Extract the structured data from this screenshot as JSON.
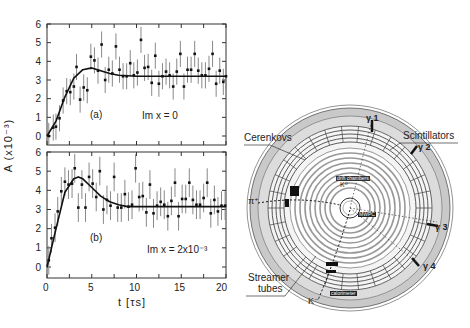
{
  "figure": {
    "ylabel": "A (x10⁻³)",
    "xlabel": "t [τs]",
    "xticks": [
      "0",
      "5",
      "10",
      "15",
      "20"
    ],
    "yticks": [
      "0",
      "1",
      "2",
      "3",
      "4",
      "5",
      "6"
    ]
  },
  "chart_data": [
    {
      "type": "scatter",
      "panel": "(a)",
      "annotation": "Im x = 0",
      "xlabel": "t [τs]",
      "ylabel": "A (x10⁻³)",
      "xlim": [
        0,
        20
      ],
      "ylim": [
        -0.5,
        6.2
      ],
      "series": [
        {
          "name": "data",
          "x": [
            0.2,
            0.7,
            1.0,
            1.4,
            1.8,
            2.2,
            2.6,
            3.0,
            3.3,
            3.7,
            4.1,
            4.5,
            4.9,
            5.3,
            5.7,
            6.1,
            6.5,
            6.9,
            7.3,
            7.7,
            8.1,
            8.5,
            8.9,
            9.3,
            9.7,
            10.1,
            10.5,
            10.9,
            11.3,
            11.7,
            12.1,
            12.5,
            12.9,
            13.3,
            13.7,
            14.1,
            14.5,
            14.9,
            15.3,
            15.7,
            16.1,
            16.5,
            16.9,
            17.3,
            17.7,
            18.1,
            18.5,
            18.9,
            19.3,
            19.7,
            20.0
          ],
          "y": [
            0.0,
            0.45,
            0.5,
            0.95,
            1.9,
            2.4,
            2.35,
            2.65,
            3.7,
            1.95,
            2.6,
            2.45,
            4.25,
            4.05,
            3.5,
            4.9,
            3.0,
            3.55,
            3.35,
            4.8,
            3.55,
            3.2,
            3.2,
            3.9,
            3.25,
            3.4,
            5.15,
            3.65,
            3.7,
            2.85,
            4.3,
            2.8,
            3.2,
            3.45,
            3.25,
            2.65,
            3.45,
            4.4,
            2.65,
            3.55,
            3.55,
            4.4,
            3.5,
            3.25,
            3.25,
            3.6,
            4.4,
            2.8,
            3.5,
            2.9,
            3.2
          ],
          "err": 0.7
        },
        {
          "name": "fit",
          "x": [
            0,
            1,
            2,
            3,
            4,
            5,
            6,
            7,
            8,
            10,
            12,
            15,
            20
          ],
          "y": [
            0.0,
            0.8,
            2.1,
            3.1,
            3.55,
            3.65,
            3.5,
            3.35,
            3.25,
            3.2,
            3.2,
            3.2,
            3.2
          ]
        }
      ]
    },
    {
      "type": "scatter",
      "panel": "(b)",
      "annotation": "Im x = 2x10⁻³",
      "xlabel": "t [τs]",
      "ylabel": "A (x10⁻³)",
      "xlim": [
        0,
        20
      ],
      "ylim": [
        -0.5,
        6.2
      ],
      "series": [
        {
          "name": "data",
          "x": [
            0.2,
            0.5,
            0.9,
            1.2,
            1.6,
            2.0,
            2.4,
            2.8,
            3.1,
            3.5,
            3.9,
            4.3,
            4.7,
            5.1,
            5.5,
            5.9,
            6.3,
            6.7,
            7.1,
            7.5,
            7.9,
            8.3,
            8.7,
            9.1,
            9.5,
            9.9,
            10.3,
            10.7,
            11.1,
            11.5,
            11.9,
            12.3,
            12.7,
            13.1,
            13.5,
            13.9,
            14.3,
            14.7,
            15.1,
            15.5,
            15.9,
            16.3,
            16.7,
            17.1,
            17.5,
            17.9,
            18.3,
            18.7,
            19.1,
            19.5,
            19.9
          ],
          "y": [
            0.35,
            1.5,
            2.05,
            2.9,
            3.95,
            4.45,
            4.3,
            4.35,
            5.15,
            3.1,
            4.3,
            3.1,
            4.7,
            4.35,
            3.65,
            5.0,
            3.0,
            3.5,
            3.2,
            4.7,
            3.1,
            3.1,
            3.8,
            3.15,
            3.25,
            5.15,
            3.65,
            3.7,
            2.85,
            4.3,
            2.8,
            3.2,
            3.4,
            3.25,
            2.65,
            3.45,
            4.4,
            2.65,
            3.55,
            3.55,
            4.4,
            3.5,
            3.25,
            3.25,
            3.6,
            4.4,
            2.8,
            3.5,
            2.9,
            3.2,
            3.2
          ],
          "err": 0.75
        },
        {
          "name": "fit",
          "x": [
            0,
            1,
            2,
            3,
            3.5,
            4,
            5,
            6,
            7,
            8,
            9,
            10,
            15,
            20
          ],
          "y": [
            0.0,
            2.0,
            3.9,
            4.6,
            4.7,
            4.6,
            4.15,
            3.7,
            3.4,
            3.25,
            3.15,
            3.15,
            3.15,
            3.15
          ]
        }
      ]
    }
  ],
  "detector": {
    "labels": {
      "cerenkovs": "Cerenkovs",
      "scintillators": "Scintillators",
      "streamer": "Streamer",
      "tubes": "tubes",
      "pi_plus": "π⁺",
      "k_minus": "K⁻",
      "k0": "K⁰",
      "mwpc": "MWPC",
      "drift": "drift chambers",
      "calorimeter": "calorimeter",
      "g1": "γ 1",
      "g2": "γ 2",
      "g3": "γ 3",
      "g4": "γ 4"
    }
  }
}
